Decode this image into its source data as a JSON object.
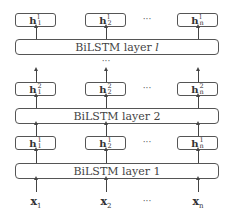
{
  "diagram": {
    "ellipsis": "···",
    "vertical_ellipsis": "···",
    "layers": [
      {
        "id": "layer_l",
        "label_prefix": "BiLSTM layer ",
        "label_index": "l",
        "outputs": [
          {
            "base": "h",
            "sup": "l",
            "sub": "1"
          },
          {
            "base": "h",
            "sup": "l",
            "sub": "2"
          },
          {
            "base": "h",
            "sup": "l",
            "sub": "n"
          }
        ]
      },
      {
        "id": "layer_2",
        "label_prefix": "BiLSTM layer ",
        "label_index": "2",
        "outputs": [
          {
            "base": "h",
            "sup": "2",
            "sub": "1"
          },
          {
            "base": "h",
            "sup": "2",
            "sub": "2"
          },
          {
            "base": "h",
            "sup": "2",
            "sub": "n"
          }
        ]
      },
      {
        "id": "layer_1",
        "label_prefix": "BiLSTM layer ",
        "label_index": "1",
        "outputs": [
          {
            "base": "h",
            "sup": "1",
            "sub": "1"
          },
          {
            "base": "h",
            "sup": "1",
            "sub": "2"
          },
          {
            "base": "h",
            "sup": "1",
            "sub": "n"
          }
        ]
      }
    ],
    "inputs": [
      {
        "base": "x",
        "sub": "1"
      },
      {
        "base": "x",
        "sub": "2"
      },
      {
        "base": "x",
        "sub": "n"
      }
    ]
  }
}
